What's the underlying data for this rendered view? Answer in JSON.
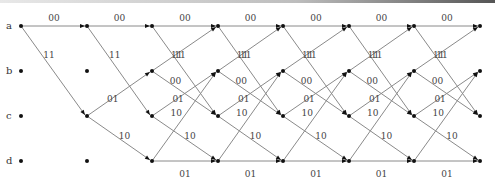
{
  "diagram": {
    "type": "trellis",
    "states": [
      {
        "name": "a",
        "y": 26
      },
      {
        "name": "b",
        "y": 71
      },
      {
        "name": "c",
        "y": 116
      },
      {
        "name": "d",
        "y": 161
      }
    ],
    "columns_x": [
      21,
      87,
      152,
      218,
      283,
      349,
      414,
      480
    ],
    "transitions": [
      {
        "from": "a",
        "to": "a",
        "output": "00"
      },
      {
        "from": "a",
        "to": "c",
        "output": "11"
      },
      {
        "from": "b",
        "to": "a",
        "output": "11"
      },
      {
        "from": "b",
        "to": "c",
        "output": "00"
      },
      {
        "from": "c",
        "to": "b",
        "output": "01"
      },
      {
        "from": "c",
        "to": "d",
        "output": "10"
      },
      {
        "from": "d",
        "to": "b",
        "output": "10"
      },
      {
        "from": "d",
        "to": "d",
        "output": "01"
      }
    ],
    "initial_state": "a"
  }
}
